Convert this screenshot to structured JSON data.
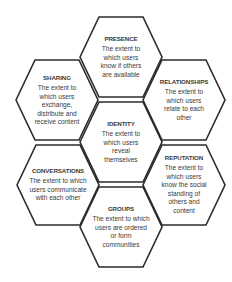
{
  "diagram": {
    "type": "honeycomb",
    "colors": {
      "stroke": "#2b2b2b",
      "fill": "#ffffff",
      "text": "#3a3a3a"
    },
    "hexagons": [
      {
        "id": "presence",
        "title": "PRESENCE",
        "description": "The extent to which users know if others are available",
        "cx": 121,
        "cy": 57
      },
      {
        "id": "sharing",
        "title": "SHARING",
        "description": "The extent to which users exchange, distribute and receive content",
        "cx": 57,
        "cy": 100
      },
      {
        "id": "relationships",
        "title": "RELATIONSHIPS",
        "description": "The extent to which users relate to each other",
        "cx": 184,
        "cy": 100
      },
      {
        "id": "identity",
        "title": "IDENTITY",
        "description": "The extent to which users reveal themselves",
        "cx": 121,
        "cy": 142
      },
      {
        "id": "conversations",
        "title": "CONVERSATIONS",
        "description": "The extent to which users communicate with each other",
        "cx": 58,
        "cy": 185
      },
      {
        "id": "reputation",
        "title": "REPUTATION",
        "description": "The extent to which users know the social standing of others and content",
        "cx": 184,
        "cy": 185
      },
      {
        "id": "groups",
        "title": "GROUPS",
        "description": "The extent to which users are ordered or form communities",
        "cx": 121,
        "cy": 227
      }
    ]
  }
}
